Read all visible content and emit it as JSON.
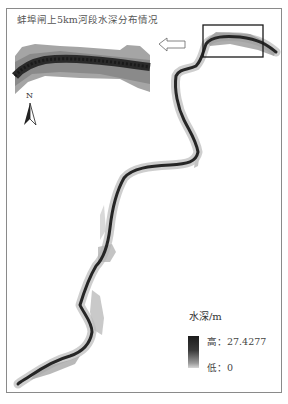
{
  "map": {
    "title": "蚌埠闸上5km河段水深分布情况",
    "north_label": "N",
    "legend": {
      "title": "水深/m",
      "high_label": "高：27.4277",
      "low_label": "低：0",
      "high_value": 27.4277,
      "low_value": 0,
      "color_high": "#1c1c1c",
      "color_low": "#d6d6d6"
    },
    "inset": {
      "description": "enlarged view of boxed river section",
      "arrow_direction": "left"
    },
    "icons": [
      "north-arrow-icon",
      "left-arrow-icon",
      "inset-box"
    ]
  }
}
